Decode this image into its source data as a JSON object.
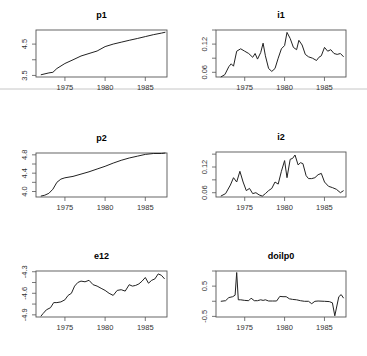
{
  "chart_data": [
    {
      "type": "line",
      "title": "p1",
      "xlabel": "",
      "ylabel": "",
      "x_ticks": [
        1975,
        1980,
        1985
      ],
      "y_ticks": [
        "3.5",
        "4.5"
      ],
      "y_tick_values": [
        3.5,
        4.5
      ],
      "ylim": [
        3.45,
        4.95
      ],
      "xlim": [
        1971.4,
        1987.7
      ],
      "x": [
        1972.0,
        1973.0,
        1973.5,
        1974.0,
        1975.0,
        1976.0,
        1977.0,
        1978.0,
        1979.0,
        1980.0,
        1981.0,
        1982.0,
        1983.0,
        1984.0,
        1985.0,
        1986.0,
        1987.0,
        1987.5
      ],
      "values": [
        3.52,
        3.58,
        3.6,
        3.72,
        3.88,
        4.0,
        4.12,
        4.2,
        4.28,
        4.42,
        4.5,
        4.56,
        4.62,
        4.68,
        4.74,
        4.8,
        4.85,
        4.88
      ]
    },
    {
      "type": "line",
      "title": "i1",
      "x_ticks": [
        1975,
        1980,
        1985
      ],
      "y_ticks": [
        "0.06",
        "0.12"
      ],
      "y_tick_values": [
        0.06,
        0.12
      ],
      "ylim": [
        0.05,
        0.15
      ],
      "xlim": [
        1971.4,
        1987.7
      ],
      "x": [
        1972.0,
        1972.5,
        1973.0,
        1973.3,
        1973.6,
        1974.0,
        1974.5,
        1975.0,
        1975.5,
        1976.0,
        1976.3,
        1976.6,
        1977.0,
        1977.3,
        1977.6,
        1978.0,
        1978.4,
        1978.8,
        1979.2,
        1979.6,
        1980.0,
        1980.3,
        1980.7,
        1981.1,
        1981.5,
        1981.8,
        1982.2,
        1982.6,
        1983.0,
        1983.5,
        1984.0,
        1984.3,
        1984.6,
        1985.0,
        1985.4,
        1985.8,
        1986.2,
        1986.6,
        1987.0,
        1987.4
      ],
      "values": [
        0.05,
        0.055,
        0.072,
        0.078,
        0.073,
        0.105,
        0.11,
        0.105,
        0.1,
        0.092,
        0.1,
        0.088,
        0.102,
        0.122,
        0.095,
        0.068,
        0.062,
        0.068,
        0.09,
        0.11,
        0.117,
        0.145,
        0.132,
        0.113,
        0.108,
        0.128,
        0.118,
        0.098,
        0.093,
        0.09,
        0.085,
        0.092,
        0.095,
        0.113,
        0.105,
        0.108,
        0.1,
        0.098,
        0.1,
        0.093
      ]
    },
    {
      "type": "line",
      "title": "p2",
      "x_ticks": [
        1975,
        1980,
        1985
      ],
      "y_ticks": [
        "4.0",
        "4.4",
        "4.8"
      ],
      "y_tick_values": [
        4.0,
        4.4,
        4.8
      ],
      "ylim": [
        3.88,
        4.84
      ],
      "xlim": [
        1971.4,
        1987.7
      ],
      "x": [
        1972.0,
        1972.5,
        1973.0,
        1973.5,
        1974.0,
        1974.5,
        1975.0,
        1976.0,
        1977.0,
        1978.0,
        1979.0,
        1980.0,
        1981.0,
        1982.0,
        1983.0,
        1984.0,
        1985.0,
        1986.0,
        1987.0,
        1987.5
      ],
      "values": [
        3.9,
        3.92,
        3.96,
        4.05,
        4.2,
        4.27,
        4.3,
        4.33,
        4.38,
        4.43,
        4.49,
        4.55,
        4.62,
        4.68,
        4.73,
        4.77,
        4.81,
        4.83,
        4.83,
        4.84
      ]
    },
    {
      "type": "line",
      "title": "i2",
      "x_ticks": [
        1975,
        1980,
        1985
      ],
      "y_ticks": [
        "0.06",
        "0.12"
      ],
      "y_tick_values": [
        0.06,
        0.12
      ],
      "ylim": [
        0.05,
        0.155
      ],
      "xlim": [
        1971.4,
        1987.7
      ],
      "x": [
        1972.0,
        1972.6,
        1973.2,
        1973.6,
        1974.0,
        1974.4,
        1974.8,
        1975.2,
        1975.6,
        1976.0,
        1976.4,
        1976.8,
        1977.2,
        1977.6,
        1978.0,
        1978.4,
        1978.8,
        1979.2,
        1979.6,
        1980.0,
        1980.3,
        1980.7,
        1981.0,
        1981.3,
        1981.7,
        1982.0,
        1982.3,
        1982.7,
        1983.0,
        1983.4,
        1983.8,
        1984.2,
        1984.6,
        1985.0,
        1985.5,
        1986.0,
        1986.5,
        1987.0,
        1987.4
      ],
      "values": [
        0.052,
        0.058,
        0.078,
        0.095,
        0.085,
        0.11,
        0.085,
        0.065,
        0.07,
        0.058,
        0.06,
        0.055,
        0.052,
        0.058,
        0.065,
        0.07,
        0.085,
        0.08,
        0.11,
        0.135,
        0.095,
        0.138,
        0.14,
        0.148,
        0.125,
        0.13,
        0.128,
        0.1,
        0.093,
        0.093,
        0.095,
        0.102,
        0.105,
        0.085,
        0.075,
        0.072,
        0.068,
        0.06,
        0.065
      ]
    },
    {
      "type": "line",
      "title": "e12",
      "x_ticks": [
        1975,
        1980,
        1985
      ],
      "y_ticks": [
        "-4.9",
        "-4.6",
        "-4.3"
      ],
      "y_tick_values": [
        -4.9,
        -4.6,
        -4.3
      ],
      "ylim": [
        -4.93,
        -4.29
      ],
      "xlim": [
        1971.4,
        1987.7
      ],
      "x": [
        1972.0,
        1972.3,
        1972.7,
        1973.2,
        1973.6,
        1974.0,
        1974.5,
        1975.0,
        1975.4,
        1975.8,
        1976.2,
        1976.6,
        1977.0,
        1977.5,
        1978.0,
        1978.5,
        1979.0,
        1979.5,
        1980.0,
        1980.5,
        1981.0,
        1981.5,
        1982.0,
        1982.5,
        1983.0,
        1983.4,
        1983.8,
        1984.2,
        1984.6,
        1985.0,
        1985.4,
        1985.8,
        1986.2,
        1986.6,
        1987.0,
        1987.4
      ],
      "values": [
        -4.92,
        -4.88,
        -4.83,
        -4.8,
        -4.73,
        -4.73,
        -4.72,
        -4.69,
        -4.63,
        -4.6,
        -4.5,
        -4.45,
        -4.43,
        -4.44,
        -4.42,
        -4.48,
        -4.5,
        -4.53,
        -4.56,
        -4.6,
        -4.63,
        -4.56,
        -4.55,
        -4.57,
        -4.48,
        -4.5,
        -4.49,
        -4.47,
        -4.43,
        -4.38,
        -4.46,
        -4.42,
        -4.4,
        -4.33,
        -4.35,
        -4.4
      ]
    },
    {
      "type": "line",
      "title": "doilp0",
      "x_ticks": [
        1975,
        1980,
        1985
      ],
      "y_ticks": [
        "-0.5",
        "0.5"
      ],
      "y_tick_values": [
        -0.5,
        0.5
      ],
      "ylim": [
        -0.52,
        1.0
      ],
      "xlim": [
        1971.4,
        1987.7
      ],
      "x": [
        1972.0,
        1972.6,
        1973.0,
        1973.5,
        1973.8,
        1974.0,
        1974.2,
        1974.5,
        1975.0,
        1975.5,
        1975.8,
        1976.2,
        1976.6,
        1977.0,
        1977.3,
        1977.6,
        1978.0,
        1978.5,
        1979.0,
        1979.4,
        1979.8,
        1980.2,
        1980.6,
        1981.0,
        1981.5,
        1982.0,
        1982.5,
        1983.0,
        1983.4,
        1983.8,
        1984.2,
        1985.0,
        1985.6,
        1986.0,
        1986.3,
        1986.8,
        1987.1,
        1987.4
      ],
      "values": [
        0.0,
        0.02,
        0.12,
        0.15,
        0.2,
        0.95,
        0.05,
        0.05,
        0.03,
        0.02,
        0.1,
        0.02,
        0.02,
        0.05,
        0.03,
        0.05,
        0.01,
        0.01,
        0.01,
        0.16,
        0.15,
        0.15,
        0.08,
        0.06,
        0.05,
        0.02,
        0.0,
        0.0,
        -0.08,
        0.0,
        0.01,
        0.0,
        -0.01,
        -0.05,
        -0.48,
        0.15,
        0.22,
        0.1
      ]
    }
  ],
  "colors": {
    "line": "#222222",
    "axis": "#555555",
    "divider": "#b0b0b0",
    "background": "#ffffff"
  }
}
